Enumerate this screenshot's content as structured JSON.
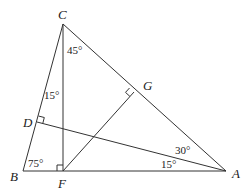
{
  "diagram": {
    "type": "geometry-triangle",
    "points": {
      "A": {
        "label": "A",
        "x": 226,
        "y": 171
      },
      "B": {
        "label": "B",
        "x": 23,
        "y": 171
      },
      "C": {
        "label": "C",
        "x": 63,
        "y": 24
      },
      "D": {
        "label": "D",
        "x": 37,
        "y": 122
      },
      "F": {
        "label": "F",
        "x": 63,
        "y": 171
      },
      "G": {
        "label": "G",
        "x": 134,
        "y": 92
      }
    },
    "segments": [
      "AB",
      "BC",
      "CA",
      "CF",
      "AD",
      "FG"
    ],
    "right_angles": [
      "F",
      "D",
      "G"
    ],
    "angles": {
      "ACF": "45°",
      "BCF": "15°",
      "ABC": "75°",
      "CAD": "30°",
      "DAB": "15°"
    }
  }
}
